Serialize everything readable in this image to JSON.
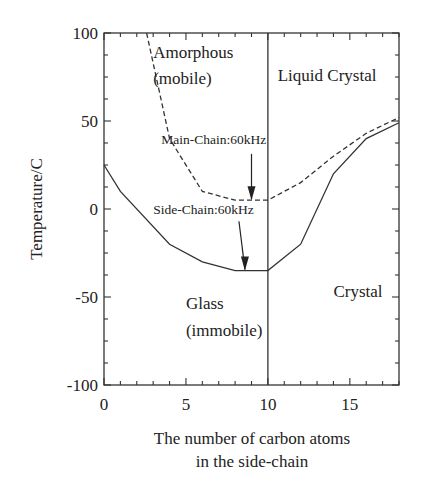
{
  "chart_data": {
    "type": "line",
    "title": "",
    "xlabel_line1": "The number of carbon atoms",
    "xlabel_line2": "in the side-chain",
    "ylabel": "Temperature/C",
    "xlim": [
      0,
      18
    ],
    "ylim": [
      -100,
      100
    ],
    "x_ticks": [
      0,
      5,
      10,
      15
    ],
    "x_tick_labels": [
      "0",
      "5",
      "10",
      "15"
    ],
    "y_ticks": [
      100,
      50,
      0,
      -50,
      -100
    ],
    "y_tick_labels": [
      "100",
      "50",
      "0",
      "-50",
      "-100"
    ],
    "grid": false,
    "series": [
      {
        "name": "Main-Chain:60kHz",
        "style": "dashed",
        "x": [
          2.6,
          4,
          6,
          8,
          10,
          12,
          14,
          16,
          18
        ],
        "y": [
          100,
          40,
          10,
          5,
          5,
          15,
          30,
          43,
          52
        ]
      },
      {
        "name": "Side-Chain:60kHz",
        "style": "solid",
        "x": [
          0,
          1,
          4,
          6,
          8,
          10,
          12,
          14,
          16,
          18
        ],
        "y": [
          25,
          10,
          -20,
          -30,
          -35,
          -35,
          -20,
          20,
          40,
          49
        ]
      }
    ],
    "vertical_line": {
      "x": 10
    },
    "annotations": [
      {
        "text": "Amorphous",
        "x": 3.0,
        "y": 86
      },
      {
        "text": "(mobile)",
        "x": 3.0,
        "y": 71
      },
      {
        "text": "Liquid Crystal",
        "x": 10.6,
        "y": 73
      },
      {
        "text": "Main-Chain:60kHz",
        "x": 3.5,
        "y": 37,
        "arrow_to": [
          9,
          5
        ]
      },
      {
        "text": "Side-Chain:60kHz",
        "x": 3.0,
        "y": -3,
        "arrow_to": [
          8.6,
          -35
        ]
      },
      {
        "text": "Glass",
        "x": 5.0,
        "y": -57
      },
      {
        "text": "(immobile)",
        "x": 5.0,
        "y": -72
      },
      {
        "text": "Crystal",
        "x": 14.0,
        "y": -50
      }
    ]
  }
}
